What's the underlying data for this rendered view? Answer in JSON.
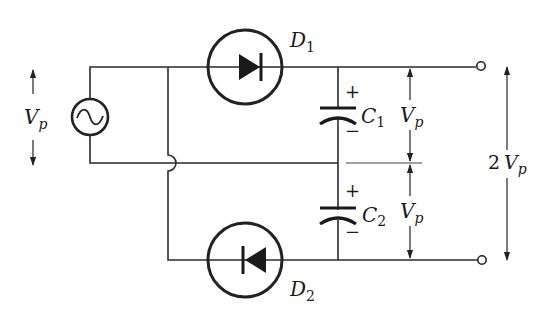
{
  "diagram": {
    "type": "voltage doubler circuit (full-wave)",
    "colors": {
      "stroke": "#222222",
      "background": "#ffffff"
    },
    "source": {
      "symbol": "ac-source",
      "label_main": "V",
      "label_sub": "p"
    },
    "diodes": [
      {
        "id": "D1",
        "label_main": "D",
        "label_sub": "1",
        "orientation": "anode-left"
      },
      {
        "id": "D2",
        "label_main": "D",
        "label_sub": "2",
        "orientation": "anode-right"
      }
    ],
    "capacitors": [
      {
        "id": "C1",
        "label_main": "C",
        "label_sub": "1",
        "plus": "+",
        "minus": "−"
      },
      {
        "id": "C2",
        "label_main": "C",
        "label_sub": "2",
        "plus": "+",
        "minus": "−"
      }
    ],
    "dimensions": {
      "c1_voltage": {
        "label_main": "V",
        "label_sub": "p"
      },
      "c2_voltage": {
        "label_main": "V",
        "label_sub": "p"
      },
      "output_voltage": {
        "prefix": "2",
        "label_main": "V",
        "label_sub": "p"
      }
    },
    "terminals": [
      "output-top",
      "output-bottom"
    ]
  }
}
